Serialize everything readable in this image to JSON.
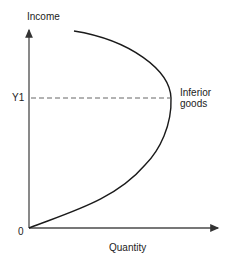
{
  "diagram": {
    "y_axis_label": "Income",
    "x_axis_label": "Quantity",
    "origin_label": "0",
    "y1_label": "Y1",
    "curve_label_line1": "Inferior",
    "curve_label_line2": "goods"
  },
  "colors": {
    "axis": "#4a4a4a",
    "curve": "#1a1a1a",
    "dashed": "#666666",
    "text": "#222222"
  }
}
